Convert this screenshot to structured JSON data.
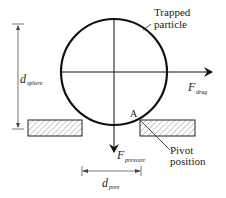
{
  "diagram": {
    "labels": {
      "trapped_particle_line1": "Trapped",
      "trapped_particle_line2": "particle",
      "f_drag_main": "F",
      "f_drag_sub": "drag",
      "f_pressure_main": "F",
      "f_pressure_sub": "pressure",
      "d_sphere_main": "d",
      "d_sphere_sub": "sphere",
      "d_pore_main": "d",
      "d_pore_sub": "pore",
      "point_a": "A",
      "pivot_line1": "Pivot",
      "pivot_line2": "position"
    },
    "colors": {
      "stroke": "#111111",
      "hatch": "#888888",
      "dimension": "#555555"
    }
  }
}
